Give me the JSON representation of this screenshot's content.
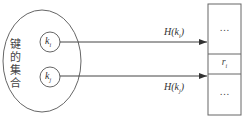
{
  "diagram": {
    "set_label": "键的集合",
    "keys": [
      {
        "name": "k",
        "sub": "i"
      },
      {
        "name": "k",
        "sub": "j"
      }
    ],
    "arrows": [
      {
        "label": "H(k_i)",
        "label_text": "H(k",
        "label_sub": "i",
        "label_close": ")"
      },
      {
        "label": "H(k_j)",
        "label_text": "H(k",
        "label_sub": "j",
        "label_close": ")"
      }
    ],
    "table": {
      "cells": [
        "…",
        "r_i",
        "…"
      ],
      "top": "…",
      "middle_name": "r",
      "middle_sub": "i",
      "bottom": "…"
    },
    "colors": {
      "line": "#555555",
      "text": "#333333"
    }
  }
}
